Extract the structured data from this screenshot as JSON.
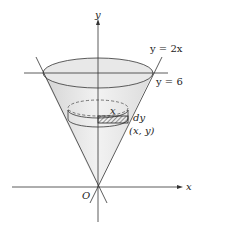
{
  "diagram": {
    "type": "solid of revolution (cone) with cylindrical shell slice",
    "axes": {
      "x_label": "x",
      "y_label": "y",
      "origin_label": "O"
    },
    "curves": [
      {
        "label": "y = 2x"
      },
      {
        "label": "y = 6"
      }
    ],
    "slice": {
      "radius_label": "x",
      "thickness_label": "dy",
      "point_label": "(x, y)"
    },
    "colors": {
      "line": "#333333",
      "fill": "#e6e6e6",
      "background": "#ffffff"
    }
  }
}
